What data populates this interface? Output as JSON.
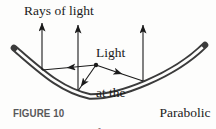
{
  "labels": {
    "rays_of_light": "Rays of light",
    "light_at_the_focus": [
      "Light",
      "at the",
      "focus"
    ],
    "parabolic_mirror": [
      "Parabolic",
      "mirror"
    ],
    "figure_caption": "FIGURE 10"
  },
  "colors": {
    "background": "#fdfdfc",
    "ink": "#1b1b1b",
    "mirror_band": "#3b3b3b",
    "caption_gray": "#58585a"
  }
}
